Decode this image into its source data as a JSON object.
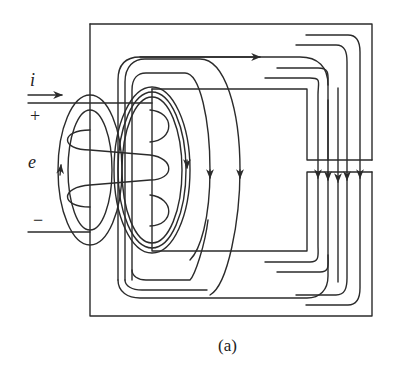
{
  "figure": {
    "caption": "(a)",
    "labels": {
      "current": "i",
      "plus": "+",
      "emf": "e",
      "minus": "−"
    },
    "elements": {
      "core": "magnetic-core-with-air-gap",
      "coil": "excitation-winding",
      "flux_lines": "magnetic-flux-paths",
      "fringing": "air-gap-fringing-flux"
    },
    "colors": {
      "stroke": "#2b2b2b",
      "background": "#ffffff"
    }
  }
}
